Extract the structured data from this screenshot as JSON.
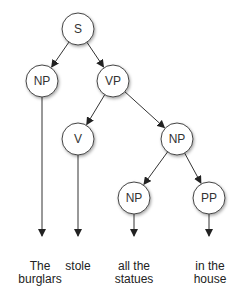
{
  "diagram": {
    "type": "parse-tree",
    "nodes": [
      {
        "id": "S",
        "label": "S",
        "x": 78,
        "y": 29
      },
      {
        "id": "NP1",
        "label": "NP",
        "x": 42,
        "y": 81
      },
      {
        "id": "VP",
        "label": "VP",
        "x": 113,
        "y": 81
      },
      {
        "id": "V",
        "label": "V",
        "x": 78,
        "y": 139
      },
      {
        "id": "NP2",
        "label": "NP",
        "x": 177,
        "y": 139
      },
      {
        "id": "NP3",
        "label": "NP",
        "x": 134,
        "y": 198
      },
      {
        "id": "PP",
        "label": "PP",
        "x": 209,
        "y": 198
      }
    ],
    "edges": [
      [
        "S",
        "NP1"
      ],
      [
        "S",
        "VP"
      ],
      [
        "VP",
        "V"
      ],
      [
        "VP",
        "NP2"
      ],
      [
        "NP2",
        "NP3"
      ],
      [
        "NP2",
        "PP"
      ]
    ],
    "leaves": [
      {
        "parent": "NP1",
        "line1": "The",
        "line2": "burglars",
        "x": 40
      },
      {
        "parent": "V",
        "line1": "stole",
        "line2": "",
        "x": 78
      },
      {
        "parent": "NP3",
        "line1": "all the",
        "line2": "statues",
        "x": 134
      },
      {
        "parent": "PP",
        "line1": "in the",
        "line2": "house",
        "x": 210
      }
    ],
    "colors": {
      "node_fill": "#ffffff",
      "node_stroke": "#444444",
      "edge": "#333333",
      "text": "#333333"
    }
  }
}
